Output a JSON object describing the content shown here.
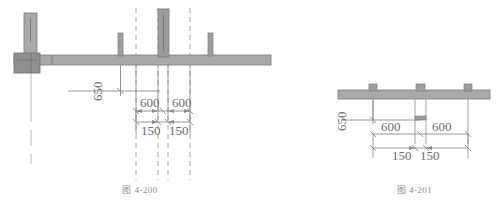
{
  "page": {
    "background": "#ffffff",
    "ink": "#6b6b6b",
    "fill": "#a9a9a9",
    "stroke": "#7a7a7a",
    "dark_fill": "#8f8f8f"
  },
  "figures": [
    {
      "id": "fig-4-200",
      "caption": "图 4-200",
      "dimensions": {
        "height_650": "650",
        "span_left_600": "600",
        "span_right_600": "600",
        "offset_left_150": "150",
        "offset_right_150": "150"
      }
    },
    {
      "id": "fig-4-201",
      "caption": "图 4-201",
      "dimensions": {
        "height_650": "650",
        "span_left_600": "600",
        "span_right_600": "600",
        "offset_left_150": "150",
        "offset_right_150": "150"
      }
    }
  ]
}
